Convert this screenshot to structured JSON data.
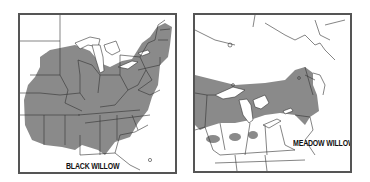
{
  "maps": [
    {
      "id": "black-willow",
      "label": "BLACK WILLOW",
      "range_color": "#8a8a8a",
      "region": "Eastern United States"
    },
    {
      "id": "meadow-willow",
      "label": "MEADOW WILLOW",
      "range_color": "#8a8a8a",
      "region": "Great Lakes and Northeast US / Southeastern Canada"
    }
  ],
  "colors": {
    "frame": "#555555",
    "range": "#8a8a8a",
    "lines": "#333333",
    "background": "#ffffff"
  }
}
